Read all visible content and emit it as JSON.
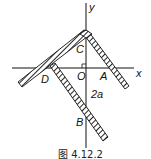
{
  "figure": {
    "caption": "图 4.12.2",
    "axes": {
      "x_label": "x",
      "y_label": "y"
    },
    "points": {
      "C": "C",
      "O": "O",
      "A": "A",
      "D": "D",
      "B": "B"
    },
    "dimension_label": "2a",
    "colors": {
      "line": "#111111",
      "hatch": "#222222",
      "background": "#ffffff"
    }
  }
}
